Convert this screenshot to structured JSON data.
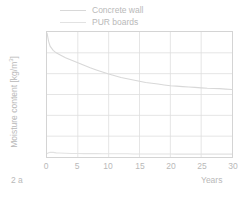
{
  "caption": "2 a",
  "legend": {
    "position": "above-plot-left",
    "entries": [
      {
        "label": "Concrete wall",
        "color": "#d8d8d8",
        "name": "legend-item-concrete-wall"
      },
      {
        "label": "PUR boards",
        "color": "#e2e2e2",
        "name": "legend-item-pur-boards"
      }
    ]
  },
  "axes": {
    "x": {
      "title": "Years",
      "ticks": [
        "0",
        "5",
        "10",
        "15",
        "20",
        "25",
        "30"
      ],
      "min": 0,
      "max": 30
    },
    "y": {
      "title_prefix": "Moisture content [kg/m",
      "title_sup": "3",
      "title_suffix": "]",
      "ticks": [
        "150",
        "125",
        "100",
        "75",
        "50",
        "25",
        "0"
      ],
      "min": 0,
      "max": 150
    }
  },
  "colors": {
    "frame": "#d4d4d4",
    "grid": "#dedede",
    "concrete_wall": "#d8d8d8",
    "pur_boards": "#e2e2e2",
    "text": "#b9b9b9",
    "background": "#ffffff"
  },
  "chart_data": {
    "type": "line",
    "title": "",
    "subtitle": "",
    "xlabel": "Years",
    "ylabel": "Moisture content [kg/m3]",
    "xlim": [
      0,
      30
    ],
    "ylim": [
      0,
      150
    ],
    "xticks": [
      0,
      5,
      10,
      15,
      20,
      25,
      30
    ],
    "yticks": [
      0,
      25,
      50,
      75,
      100,
      125,
      150
    ],
    "grid": true,
    "legend_position": "above-plot-left",
    "x": [
      0,
      0.25,
      0.5,
      1,
      1.5,
      2,
      3,
      4,
      5,
      6,
      7,
      8,
      9,
      10,
      11,
      12,
      13,
      14,
      15,
      16,
      17,
      18,
      19,
      20,
      21,
      22,
      23,
      24,
      25,
      26,
      27,
      28,
      29,
      30
    ],
    "series": [
      {
        "name": "Concrete wall",
        "color": "#d8d8d8",
        "values": [
          149,
          139,
          133,
          128,
          125,
          123,
          119,
          116,
          113,
          110,
          107,
          104.5,
          102,
          99.5,
          97.5,
          95.5,
          94,
          92.5,
          91,
          89.5,
          88.5,
          87.5,
          86.5,
          85.5,
          85,
          84.5,
          84,
          83.5,
          83,
          82.5,
          82.2,
          82,
          81.5,
          81
        ]
      },
      {
        "name": "PUR boards",
        "color": "#e2e2e2",
        "values": [
          4,
          5,
          5.5,
          5.5,
          5,
          4.8,
          4.5,
          4.3,
          4.2,
          4.1,
          4,
          4,
          3.9,
          3.9,
          3.8,
          3.8,
          3.8,
          3.7,
          3.7,
          3.7,
          3.6,
          3.6,
          3.6,
          3.6,
          3.5,
          3.5,
          3.5,
          3.5,
          3.5,
          3.4,
          3.4,
          3.4,
          3.4,
          3.4
        ]
      }
    ]
  }
}
